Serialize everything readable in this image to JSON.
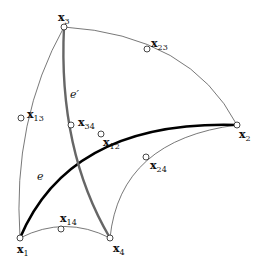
{
  "diagram": {
    "nodes": [
      {
        "id": "x1",
        "base": "x",
        "sub": "1",
        "x": 20,
        "y": 238,
        "label_x": 17,
        "label_y": 253
      },
      {
        "id": "x2",
        "base": "x",
        "sub": "2",
        "x": 237,
        "y": 125,
        "label_x": 239,
        "label_y": 138
      },
      {
        "id": "x3",
        "base": "x",
        "sub": "3",
        "x": 64,
        "y": 27,
        "label_x": 58,
        "label_y": 21
      },
      {
        "id": "x4",
        "base": "x",
        "sub": "4",
        "x": 110,
        "y": 238,
        "label_x": 113,
        "label_y": 252
      },
      {
        "id": "x12",
        "base": "x",
        "sub": "12",
        "x": 101,
        "y": 134,
        "label_x": 103,
        "label_y": 146
      },
      {
        "id": "x13",
        "base": "x",
        "sub": "13",
        "x": 21,
        "y": 118,
        "label_x": 27,
        "label_y": 118
      },
      {
        "id": "x14",
        "base": "x",
        "sub": "14",
        "x": 61,
        "y": 229,
        "label_x": 60,
        "label_y": 222
      },
      {
        "id": "x23",
        "base": "x",
        "sub": "23",
        "x": 147,
        "y": 49,
        "label_x": 151,
        "label_y": 47
      },
      {
        "id": "x24",
        "base": "x",
        "sub": "24",
        "x": 146,
        "y": 157,
        "label_x": 150,
        "label_y": 169
      },
      {
        "id": "x34",
        "base": "x",
        "sub": "34",
        "x": 71,
        "y": 125,
        "label_x": 78,
        "label_y": 126
      }
    ],
    "edges": [
      {
        "id": "x1-x3",
        "style": "thin",
        "path": "M20,238 Q12,120 64,27"
      },
      {
        "id": "x3-x2",
        "style": "thin",
        "path": "M64,27 Q190,35 237,125"
      },
      {
        "id": "x1-x4",
        "style": "thin",
        "path": "M20,238 Q65,215 110,238"
      },
      {
        "id": "x4-x2",
        "style": "thin",
        "path": "M110,238 Q120,140 237,125"
      },
      {
        "id": "e",
        "style": "e",
        "path": "M20,238 Q70,120 237,125"
      },
      {
        "id": "e-prime",
        "style": "eprime",
        "path": "M64,27 Q58,150 110,238"
      }
    ],
    "edge_labels": [
      {
        "id": "e",
        "text": "e",
        "x": 37,
        "y": 180
      },
      {
        "id": "e-prime",
        "text": "e′",
        "x": 70,
        "y": 98
      }
    ],
    "colors": {
      "thin_edge": "#555555",
      "edge_e": "#000000",
      "edge_e_prime": "#666666",
      "node_fill": "#ffffff",
      "node_stroke": "#333333"
    }
  }
}
